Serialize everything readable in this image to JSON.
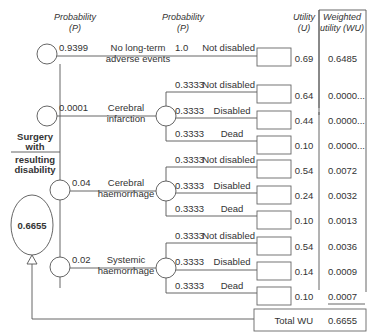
{
  "headers": {
    "prob1": [
      "Probability",
      "(P)"
    ],
    "prob2": [
      "Probability",
      "(P)"
    ],
    "utility": [
      "Utility",
      "(U)"
    ],
    "weighted": [
      "Weighted",
      "utility (WU)"
    ]
  },
  "decision": {
    "label": [
      "Surgery",
      "with",
      "resulting",
      "disability"
    ],
    "value": "0.6655"
  },
  "branches": [
    {
      "prob": "0.9399",
      "label": [
        "No long-term",
        "adverse events"
      ],
      "outcomes": [
        {
          "prob": "1.0",
          "label": "Not disabled",
          "utility": "0.69",
          "wu": "0.6485"
        }
      ]
    },
    {
      "prob": "0.0001",
      "label": [
        "Cerebral",
        "infarction"
      ],
      "outcomes": [
        {
          "prob": "0.3333",
          "label": "Not disabled",
          "utility": "0.64",
          "wu": "0.0000..."
        },
        {
          "prob": "0.3333",
          "label": "Disabled",
          "utility": "0.44",
          "wu": "0.0000..."
        },
        {
          "prob": "0.3333",
          "label": "Dead",
          "utility": "0.10",
          "wu": "0.0000..."
        }
      ]
    },
    {
      "prob": "0.04",
      "label": [
        "Cerebral",
        "haemorrhage"
      ],
      "outcomes": [
        {
          "prob": "0.3333",
          "label": "Not disabled",
          "utility": "0.54",
          "wu": "0.0072"
        },
        {
          "prob": "0.3333",
          "label": "Disabled",
          "utility": "0.24",
          "wu": "0.0032"
        },
        {
          "prob": "0.3333",
          "label": "Dead",
          "utility": "0.10",
          "wu": "0.0013"
        }
      ]
    },
    {
      "prob": "0.02",
      "label": [
        "Systemic",
        "haemorrhage"
      ],
      "outcomes": [
        {
          "prob": "0.3333",
          "label": "Not disabled",
          "utility": "0.54",
          "wu": "0.0036"
        },
        {
          "prob": "0.3333",
          "label": "Disabled",
          "utility": "0.14",
          "wu": "0.0009"
        },
        {
          "prob": "0.3333",
          "label": "Dead",
          "utility": "0.10",
          "wu": "0.0007"
        }
      ]
    }
  ],
  "total": {
    "label": "Total WU",
    "value": "0.6655"
  },
  "colors": {
    "line": "#555555",
    "text": "#333333",
    "background": "#ffffff"
  }
}
